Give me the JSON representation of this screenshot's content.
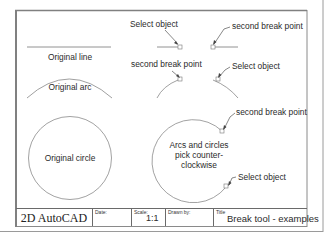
{
  "drawing": {
    "labels": {
      "original_line": "Original line",
      "original_arc": "Original arc",
      "original_circle": "Original circle",
      "line_select_object": "Select object",
      "line_second_break_point": "second break point",
      "arc_second_break_point": "second break point",
      "arc_select_object": "Select object",
      "circle_second_break_point": "second break point",
      "circle_note": "Arcs and circles pick counter-clockwise",
      "circle_select_object": "Select object"
    }
  },
  "title_block": {
    "company": "2D AutoCAD",
    "date_label": "Date:",
    "date_value": "",
    "scale_label": "Scale:",
    "scale_value": "1:1",
    "drawn_by_label": "Drawn by:",
    "drawn_by_value": "",
    "title_label": "Title",
    "title_value": "Break tool - examples"
  },
  "colors": {
    "frame": "#8a8a8a",
    "linework": "#6e6e6e",
    "text": "#2b2b2b"
  }
}
